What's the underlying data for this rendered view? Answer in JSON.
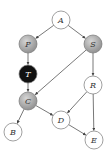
{
  "diagram": {
    "type": "directed-graph",
    "nodes": [
      {
        "id": "A",
        "label": "A",
        "x": 61,
        "y": 20,
        "fill": "#ffffff",
        "text": "#333333"
      },
      {
        "id": "P",
        "label": "P",
        "x": 28,
        "y": 44,
        "fill": "#b0b0b0",
        "text": "#333333"
      },
      {
        "id": "S",
        "label": "S",
        "x": 93,
        "y": 44,
        "fill": "#b0b0b0",
        "text": "#333333"
      },
      {
        "id": "T",
        "label": "T",
        "x": 28,
        "y": 74,
        "fill": "#111111",
        "text": "#ffffff"
      },
      {
        "id": "R",
        "label": "R",
        "x": 93,
        "y": 85,
        "fill": "#ffffff",
        "text": "#333333"
      },
      {
        "id": "C",
        "label": "C",
        "x": 28,
        "y": 101,
        "fill": "#a8a8a8",
        "text": "#333333"
      },
      {
        "id": "D",
        "label": "D",
        "x": 61,
        "y": 120,
        "fill": "#ffffff",
        "text": "#333333"
      },
      {
        "id": "B",
        "label": "B",
        "x": 13,
        "y": 132,
        "fill": "#ffffff",
        "text": "#333333"
      },
      {
        "id": "E",
        "label": "E",
        "x": 94,
        "y": 140,
        "fill": "#ffffff",
        "text": "#333333"
      }
    ],
    "edges": [
      {
        "from": "A",
        "to": "P"
      },
      {
        "from": "A",
        "to": "S"
      },
      {
        "from": "P",
        "to": "T"
      },
      {
        "from": "T",
        "to": "C"
      },
      {
        "from": "S",
        "to": "C"
      },
      {
        "from": "S",
        "to": "R"
      },
      {
        "from": "R",
        "to": "D"
      },
      {
        "from": "R",
        "to": "E"
      },
      {
        "from": "C",
        "to": "B"
      },
      {
        "from": "C",
        "to": "D"
      },
      {
        "from": "D",
        "to": "E"
      }
    ],
    "node_radius": 9,
    "stroke_color": "#555555"
  }
}
